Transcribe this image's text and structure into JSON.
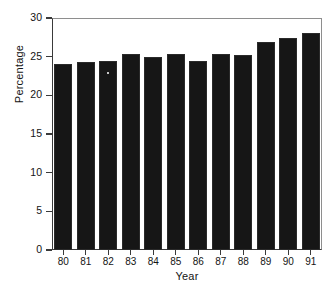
{
  "chart_data": {
    "type": "bar",
    "title": "",
    "subtitle": "",
    "xlabel": "Year",
    "ylabel": "Percentage",
    "categories": [
      "80",
      "81",
      "82",
      "83",
      "84",
      "85",
      "86",
      "87",
      "88",
      "89",
      "90",
      "91"
    ],
    "values": [
      24.0,
      24.3,
      24.4,
      25.4,
      24.9,
      25.4,
      24.5,
      25.4,
      25.2,
      26.9,
      27.4,
      28.1
    ],
    "ylim": [
      0,
      30
    ],
    "yticks": [
      0,
      5,
      10,
      15,
      20,
      25,
      30
    ],
    "ytick_labels": [
      "0",
      "5",
      "10",
      "15",
      "20",
      "25",
      "30"
    ],
    "grid": false,
    "legend": null,
    "bar_color": "#161616",
    "axis_color": "#3a3a3a",
    "background": "#ffffff"
  }
}
